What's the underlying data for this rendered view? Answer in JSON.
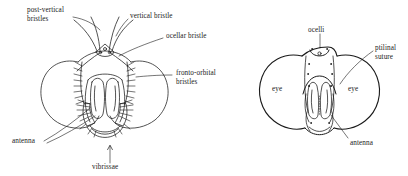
{
  "figure": {
    "background_color": "#ffffff",
    "ink_color": "#1a1a1a",
    "panels": [
      {
        "id": "left",
        "name": "bristled-fly-head-anterior-view"
      },
      {
        "id": "right",
        "name": "fly-head-ptilinal-suture-view"
      }
    ]
  },
  "labels": {
    "post_vertical_bristles": "post-vertical\nbristles",
    "vertical_bristle": "vertical bristle",
    "ocellar_bristle": "ocellar bristle",
    "fronto_orbital_bristles": "fronto-orbital\nbristles",
    "antenna_left": "antenna",
    "vibrissae": "vibrissae",
    "ocelli": "ocelli",
    "ptilinal_suture": "ptilinal\nsuture",
    "eye_left": "eye",
    "eye_right": "eye",
    "antenna_right": "antenna"
  }
}
